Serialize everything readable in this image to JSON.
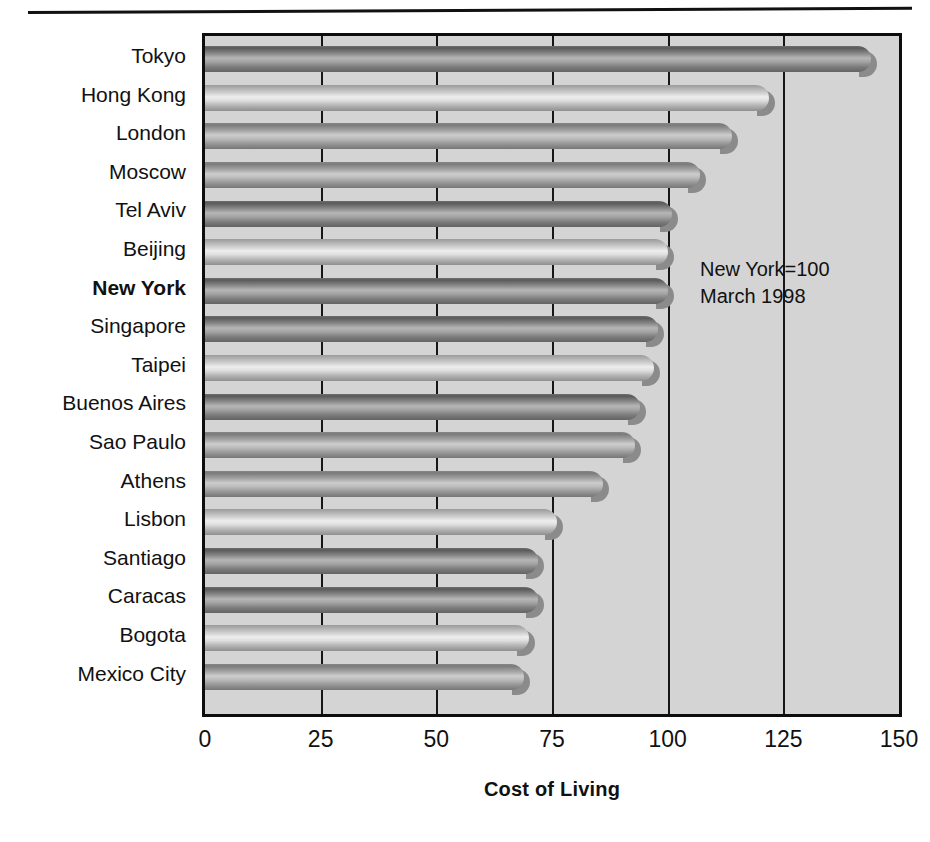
{
  "chart_data": {
    "type": "bar",
    "orientation": "horizontal",
    "title": "",
    "xlabel": "Cost of Living",
    "ylabel": "",
    "xlim": [
      0,
      150
    ],
    "xticks": [
      0,
      25,
      50,
      75,
      100,
      125,
      150
    ],
    "grid": true,
    "legend": null,
    "annotations": [
      "New York=100",
      "March 1998"
    ],
    "highlight_category": "New York",
    "categories": [
      "Tokyo",
      "Hong Kong",
      "London",
      "Moscow",
      "Tel Aviv",
      "Beijing",
      "New York",
      "Singapore",
      "Taipei",
      "Buenos Aires",
      "Sao Paulo",
      "Athens",
      "Lisbon",
      "Santiago",
      "Caracas",
      "Bogota",
      "Mexico City"
    ],
    "values": [
      144,
      122,
      114,
      107,
      101,
      100,
      100,
      98,
      97,
      94,
      93,
      86,
      76,
      72,
      72,
      70,
      69
    ],
    "shades": [
      "dark",
      "light",
      "mid",
      "mid",
      "dark",
      "light",
      "dark",
      "dark",
      "light",
      "dark",
      "mid",
      "mid",
      "light",
      "dark",
      "dark",
      "light",
      "mid"
    ],
    "colors": {
      "plot_background": "#d4d4d4",
      "frame": "#0d0d0d",
      "gridline": "#161616",
      "bar_dark": "#6e6e6e",
      "bar_light": "#cfcfcf",
      "bar_mid": "#a6a6a6",
      "text": "#111111",
      "page_background": "#ffffff"
    }
  }
}
